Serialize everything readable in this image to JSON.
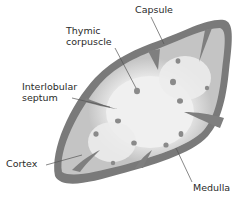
{
  "diagram": {
    "colors": {
      "capsule": "#7a7a7a",
      "septum": "#7f7f7f",
      "cortex": "#c4c4c4",
      "medulla": "#eeeeee",
      "corpuscle": "#8a8a8a",
      "leader_line": "#555555",
      "text": "#2a2a2a"
    },
    "labels": {
      "capsule": "Capsule",
      "thymic_corpuscle_line1": "Thymic",
      "thymic_corpuscle_line2": "corpuscle",
      "interlobular_septum_line1": "Interlobular",
      "interlobular_septum_line2": "septum",
      "cortex": "Cortex",
      "medulla": "Medulla"
    },
    "corpuscles": [
      {
        "x": 137,
        "y": 91
      },
      {
        "x": 178,
        "y": 61
      },
      {
        "x": 173,
        "y": 82
      },
      {
        "x": 207,
        "y": 88
      },
      {
        "x": 180,
        "y": 101
      },
      {
        "x": 118,
        "y": 121
      },
      {
        "x": 96,
        "y": 134
      },
      {
        "x": 134,
        "y": 143
      },
      {
        "x": 166,
        "y": 145
      },
      {
        "x": 181,
        "y": 134
      },
      {
        "x": 113,
        "y": 163
      }
    ]
  }
}
